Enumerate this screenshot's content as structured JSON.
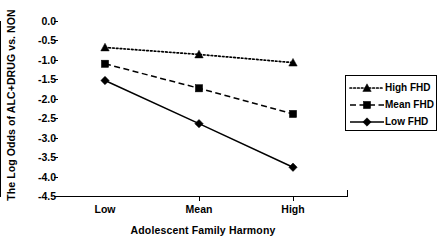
{
  "chart_data": {
    "type": "line",
    "title": "",
    "xlabel": "Adolescent Family Harmony",
    "ylabel": "The Log Odds of ALC+DRUG vs. NON",
    "categories": [
      "Low",
      "Mean",
      "High"
    ],
    "ylim": [
      -4.5,
      0.0
    ],
    "yticks": [
      "0.0",
      "-0.5",
      "-1.0",
      "-1.5",
      "-2.0",
      "-2.5",
      "-3.0",
      "-3.5",
      "-4.0",
      "-4.5"
    ],
    "ytick_values": [
      0.0,
      -0.5,
      -1.0,
      -1.5,
      -2.0,
      -2.5,
      -3.0,
      -3.5,
      -4.0,
      -4.5
    ],
    "grid": false,
    "legend_position": "right",
    "series": [
      {
        "name": "High FHD",
        "values": [
          -0.68,
          -0.86,
          -1.07
        ],
        "marker": "triangle",
        "linestyle": "dotted",
        "color": "#000000"
      },
      {
        "name": "Mean FHD",
        "values": [
          -1.1,
          -1.73,
          -2.39
        ],
        "marker": "square",
        "linestyle": "dashed",
        "color": "#000000"
      },
      {
        "name": "Low FHD",
        "values": [
          -1.53,
          -2.64,
          -3.76
        ],
        "marker": "diamond",
        "linestyle": "solid",
        "color": "#000000"
      }
    ]
  }
}
